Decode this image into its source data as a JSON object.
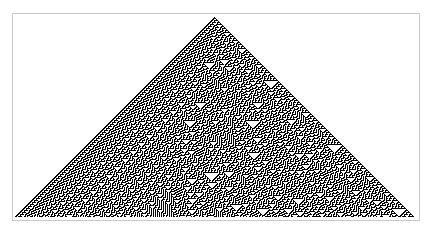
{
  "figure": {
    "kind": "elementary-cellular-automaton",
    "rule": 30,
    "generations": 200,
    "initial_condition": "single-black-cell",
    "cell_size_px": 1,
    "colors": {
      "on": "#000000",
      "off": "#ffffff",
      "frame_border": "#c8c8c8",
      "background": "#ffffff"
    }
  }
}
